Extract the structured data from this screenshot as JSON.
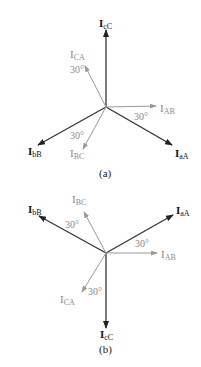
{
  "colors": {
    "line_phasor": "#333333",
    "phase_phasor": "#9a9a9a",
    "label_dark": "#111111",
    "label_gray": "#8a8a8a"
  },
  "diagram_a": {
    "caption": "(a)",
    "labels": {
      "IcC": {
        "main": "I",
        "sub": "cC"
      },
      "ICA": {
        "main": "I",
        "sub": "CA"
      },
      "IAB": {
        "main": "I",
        "sub": "AB"
      },
      "IbB": {
        "main": "I",
        "sub": "bB"
      },
      "IBC": {
        "main": "I",
        "sub": "BC"
      },
      "IaA": {
        "main": "I",
        "sub": "aA"
      }
    },
    "angles": [
      "30°",
      "30°",
      "30°"
    ]
  },
  "diagram_b": {
    "caption": "(b)",
    "labels": {
      "IbB": {
        "main": "I",
        "sub": "bB"
      },
      "IBC": {
        "main": "I",
        "sub": "BC"
      },
      "IaA": {
        "main": "I",
        "sub": "aA"
      },
      "IAB": {
        "main": "I",
        "sub": "AB"
      },
      "ICA": {
        "main": "I",
        "sub": "CA"
      },
      "IcC": {
        "main": "I",
        "sub": "cC"
      }
    },
    "angles": [
      "30°",
      "30°",
      "30°"
    ]
  }
}
